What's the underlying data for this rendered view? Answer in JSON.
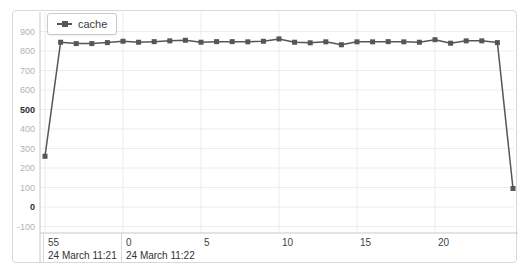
{
  "legend": {
    "label": "cache"
  },
  "colors": {
    "series": "#565656",
    "grid": "#ececec",
    "axis": "#c8c8c8",
    "divider": "#d8d8d8",
    "y_label_minor": "#b3b3b3",
    "y_label_major": "#2e2e2e",
    "x_label": "#3f3f3f",
    "date_label": "#333333",
    "panel_border": "#d8d8d8",
    "background": "#ffffff"
  },
  "chart_data": {
    "type": "line",
    "title": "",
    "xlabel": "",
    "ylabel": "",
    "legend_position": "top-left",
    "grid": true,
    "marker": "square",
    "y_ticks": [
      900,
      800,
      700,
      600,
      500,
      400,
      300,
      200,
      100,
      0,
      -100
    ],
    "y_major_ticks": [
      500,
      0
    ],
    "ylim": [
      -130,
      960
    ],
    "x_tick_labels": [
      "55",
      "0",
      "5",
      "10",
      "15",
      "20"
    ],
    "x_tick_seconds": [
      -5,
      0,
      5,
      10,
      15,
      20
    ],
    "x_date_labels": [
      "24 March 11:21",
      "24 March 11:22"
    ],
    "x_date_cell_start_seconds": [
      -5,
      0
    ],
    "xlim_seconds": [
      -5.3,
      25.3
    ],
    "series": [
      {
        "name": "cache",
        "x_seconds_from_11_22": [
          -5,
          -4,
          -3,
          -2,
          -1,
          0,
          1,
          2,
          3,
          4,
          5,
          6,
          7,
          8,
          9,
          10,
          11,
          12,
          13,
          14,
          15,
          16,
          17,
          18,
          19,
          20,
          21,
          22,
          23,
          24,
          25
        ],
        "values": [
          260,
          845,
          838,
          838,
          843,
          850,
          845,
          848,
          852,
          855,
          845,
          848,
          848,
          847,
          850,
          862,
          845,
          842,
          847,
          832,
          847,
          847,
          848,
          847,
          845,
          858,
          840,
          852,
          852,
          843,
          95
        ]
      }
    ]
  }
}
